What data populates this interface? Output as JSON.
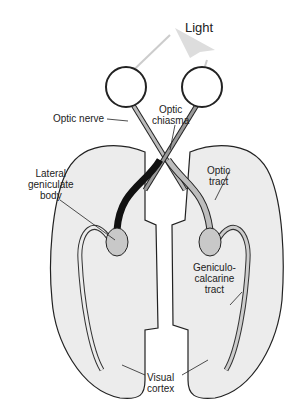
{
  "diagram": {
    "title": "Light",
    "labels": {
      "optic_nerve": "Optic nerve",
      "optic_chiasma_1": "Optic",
      "optic_chiasma_2": "chiasma",
      "lgb_1": "Lateral",
      "lgb_2": "geniculate",
      "lgb_3": "body",
      "optic_tract_1": "Optic",
      "optic_tract_2": "tract",
      "gc_1": "Geniculo-",
      "gc_2": "calcarine",
      "gc_3": "tract",
      "vc_1": "Visual",
      "vc_2": "cortex"
    },
    "colors": {
      "hemisphere": "#ececec",
      "lgb": "#c8c8c8",
      "tract_dark": "#111111",
      "tract_light": "#bdbdbd"
    }
  }
}
